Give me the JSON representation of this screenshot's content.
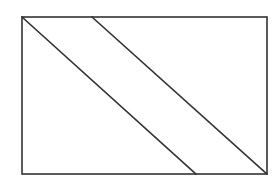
{
  "diagram": {
    "type": "geometric-figure",
    "width": 280,
    "height": 180,
    "background": "#ffffff",
    "stroke_color": "#333333",
    "stroke_width": 1.6,
    "rectangle": {
      "x": 22,
      "y": 17,
      "width": 245,
      "height": 157
    },
    "diagonals": [
      {
        "x1": 22,
        "y1": 17,
        "x2": 196,
        "y2": 174
      },
      {
        "x1": 92,
        "y1": 17,
        "x2": 267,
        "y2": 174
      }
    ]
  }
}
